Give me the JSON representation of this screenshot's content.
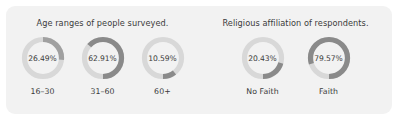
{
  "colors": {
    "card_background": "#f2f2f2",
    "page_background": "#ffffff",
    "track": "#d8d8d8",
    "arc_light": "#a8a8a8",
    "arc_dark": "#868686",
    "text": "#3b3b3b"
  },
  "chart_data": [
    {
      "type": "pie",
      "title": "Age ranges of people surveyed.",
      "xlabel": "",
      "ylabel": "",
      "categories": [
        "16–30",
        "31–60",
        "60+"
      ],
      "values": [
        26.49,
        62.91,
        10.59
      ],
      "value_labels": [
        "26.49%",
        "62.91%",
        "10.59%"
      ],
      "units": "percent",
      "legend": "none",
      "grid": false,
      "donuts": [
        {
          "label": "16–30",
          "value": 26.49,
          "value_label": "26.49%",
          "direction": "clockwise",
          "start_angle_deg": 0,
          "arc_color": "#a0a0a0",
          "track_color": "#d9d9d9"
        },
        {
          "label": "31–60",
          "value": 62.91,
          "value_label": "62.91%",
          "direction": "counterclockwise",
          "start_angle_deg": 0,
          "arc_color": "#8a8a8a",
          "track_color": "#d9d9d9"
        },
        {
          "label": "60+",
          "value": 10.59,
          "value_label": "10.59%",
          "direction": "counterclockwise",
          "start_angle_deg": 0,
          "arc_color": "#8a8a8a",
          "track_color": "#d9d9d9"
        }
      ]
    },
    {
      "type": "pie",
      "title": "Religious affiliation of respondents.",
      "xlabel": "",
      "ylabel": "",
      "categories": [
        "No Faith",
        "Faith"
      ],
      "values": [
        20.43,
        79.57
      ],
      "value_labels": [
        "20.43%",
        "79.57%"
      ],
      "units": "percent",
      "legend": "none",
      "grid": false,
      "donuts": [
        {
          "label": "No Faith",
          "value": 20.43,
          "value_label": "20.43%",
          "direction": "counterclockwise",
          "start_angle_deg": 0,
          "arc_color": "#8a8a8a",
          "track_color": "#d9d9d9"
        },
        {
          "label": "Faith",
          "value": 79.57,
          "value_label": "79.57%",
          "direction": "counterclockwise",
          "start_angle_deg": 0,
          "arc_color": "#8a8a8a",
          "track_color": "#d9d9d9"
        }
      ]
    }
  ]
}
